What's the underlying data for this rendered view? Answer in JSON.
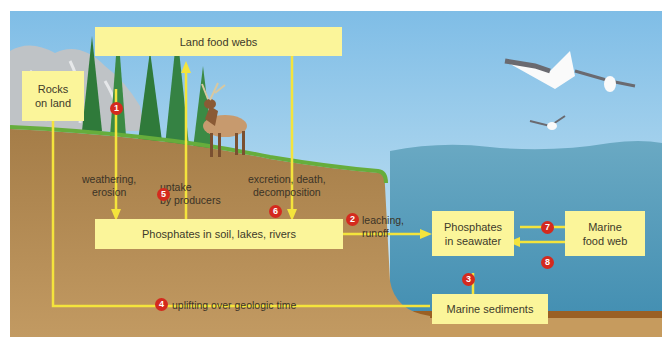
{
  "diagram": {
    "boxes": {
      "rocks_on_land": "Rocks\non land",
      "land_food_webs": "Land food webs",
      "phosphates_soil": "Phosphates in soil, lakes, rivers",
      "phosphates_seawater": "Phosphates\nin seawater",
      "marine_food_web": "Marine\nfood web",
      "marine_sediments": "Marine sediments"
    },
    "processes": [
      {
        "number": "1",
        "label": "weathering,\nerosion"
      },
      {
        "number": "2",
        "label": "leaching,\nrunoff"
      },
      {
        "number": "3",
        "label": ""
      },
      {
        "number": "4",
        "label": "uplifting over geologic time"
      },
      {
        "number": "5",
        "label": "uptake\nby producers"
      },
      {
        "number": "6",
        "label": "excretion, death,\ndecomposition"
      },
      {
        "number": "7",
        "label": ""
      },
      {
        "number": "8",
        "label": ""
      }
    ],
    "colors": {
      "box_fill": "#fbf59a",
      "arrow": "#f4e43c",
      "badge": "#d42a1e",
      "soil": "#b8915c",
      "sky": "#a9d3ee",
      "sea": "#4a94b4",
      "grass": "#62a93a"
    },
    "illustration": [
      "rock-cliff",
      "conifer-trees",
      "elk",
      "seagulls",
      "ocean",
      "land-slope"
    ]
  }
}
